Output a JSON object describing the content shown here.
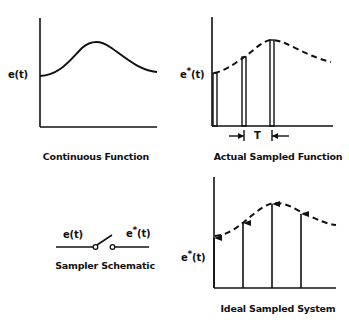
{
  "panels": {
    "continuous": {
      "caption": "Continuous Function",
      "ylabel": "e(t)"
    },
    "actual_sampled": {
      "caption": "Actual Sampled Function",
      "ylabel_base": "e",
      "ylabel_sup": "*",
      "ylabel_arg": "(t)",
      "period_label": "T"
    },
    "sampler": {
      "caption": "Sampler Schematic",
      "input_label": "e(t)",
      "output_base": "e",
      "output_sup": "*",
      "output_arg": "(t)"
    },
    "ideal_sampled": {
      "caption": "Ideal Sampled System",
      "ylabel_base": "e",
      "ylabel_sup": "*",
      "ylabel_arg": "(t)"
    }
  },
  "colors": {
    "ink": "#111111",
    "background": "#ffffff"
  }
}
